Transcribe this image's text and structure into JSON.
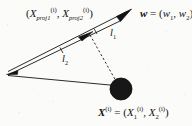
{
  "figure": {
    "background_color": "#fbfbfa",
    "ink_color": "#131313",
    "width": 192,
    "height": 126
  },
  "labels": {
    "projection_point": {
      "open_paren": "(",
      "var1": "X",
      "var1_sub": "proj1",
      "var1_sup": "(i)",
      "comma": ", ",
      "var2": "X",
      "var2_sub": "proj2",
      "var2_sup": "(i)",
      "close_paren": ")",
      "plain": "(X_proj1^(i), X_proj2^(i))"
    },
    "weight_vector": {
      "vec": "w",
      "equals": " = (",
      "comp1": "w",
      "comp1_sub": "1",
      "comma": ", ",
      "comp2": "w",
      "comp2_sub": "2",
      "close_paren": ")",
      "plain": "w = (w1, w2)"
    },
    "segment_l1": {
      "symbol": "l",
      "sub": "1",
      "plain": "l1"
    },
    "segment_l2": {
      "symbol": "l",
      "sub": "2",
      "plain": "l2"
    },
    "data_point": {
      "vec": "X",
      "vec_sup": "(i)",
      "equals": " = (",
      "comp1": "X",
      "comp1_sub": "1",
      "comp1_sup": "(i)",
      "comma": ", ",
      "comp2": "X",
      "comp2_sub": "2",
      "comp2_sup": "(i)",
      "close_paren": ")",
      "plain": "X^(i) = (X_1^(i), X_2^(i))"
    }
  },
  "geometry": {
    "origin_vertex": {
      "x": 8,
      "y": 73
    },
    "vector_arrow_tip": {
      "x": 130,
      "y": 10
    },
    "projection_point": {
      "x": 90,
      "y": 34
    },
    "data_point_center": {
      "x": 121,
      "y": 89
    },
    "data_point_radius": 11,
    "stroke_width": 0.9,
    "dash_pattern": "2.2 2.2"
  }
}
